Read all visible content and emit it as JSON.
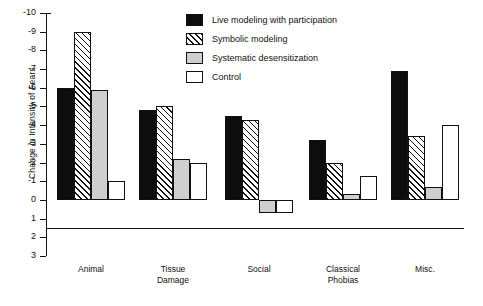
{
  "chart_data": {
    "type": "bar",
    "title": "",
    "xlabel": "",
    "ylabel": "Change in Intensity of Fears",
    "categories": [
      "Animal",
      "Tissue\nDamage",
      "Social",
      "Classical\nPhobias",
      "Misc."
    ],
    "ylim": [
      -10,
      3
    ],
    "y_inverted": true,
    "grid": false,
    "legend_position": "top-right",
    "yticks": [
      "-10",
      "-9",
      "-8",
      "-7",
      "-6",
      "-5",
      "-4",
      "-3",
      "-2",
      "-1",
      "0",
      "1",
      "2",
      "3"
    ],
    "ytick_values": [
      -10,
      -9,
      -8,
      -7,
      -6,
      -5,
      -4,
      -3,
      -2,
      -1,
      0,
      1,
      2,
      3
    ],
    "series": [
      {
        "name": "Live modeling with participation",
        "fill": "solid-black",
        "color": "#0d0d0d",
        "values": [
          -6.0,
          -4.8,
          -4.5,
          -3.2,
          -6.9
        ]
      },
      {
        "name": "Symbolic modeling",
        "fill": "diagonal-hatch",
        "color": "#ffffff",
        "values": [
          -9.0,
          -5.0,
          -4.3,
          -2.0,
          -3.4
        ]
      },
      {
        "name": "Systematic desensitization",
        "fill": "solid-gray",
        "color": "#cfcfcf",
        "values": [
          -5.9,
          -2.2,
          0.7,
          -0.3,
          -0.7
        ]
      },
      {
        "name": "Control",
        "fill": "solid-white",
        "color": "#ffffff",
        "values": [
          -1.0,
          -2.0,
          0.7,
          -1.3,
          -4.0
        ]
      }
    ]
  },
  "categories_display": [
    "Animal",
    "Tissue Damage",
    "Social",
    "Classical Phobias",
    "Misc."
  ],
  "category_lines": [
    [
      "Animal"
    ],
    [
      "Tissue",
      "Damage"
    ],
    [
      "Social"
    ],
    [
      "Classical",
      "Phobias"
    ],
    [
      "Misc."
    ]
  ],
  "legend": {
    "items": [
      {
        "label": "Live modeling with participation",
        "swatch": "solid-black"
      },
      {
        "label": "Symbolic modeling",
        "swatch": "diagonal-hatch"
      },
      {
        "label": "Systematic desensitization",
        "swatch": "solid-gray"
      },
      {
        "label": "Control",
        "swatch": "solid-white"
      }
    ]
  }
}
